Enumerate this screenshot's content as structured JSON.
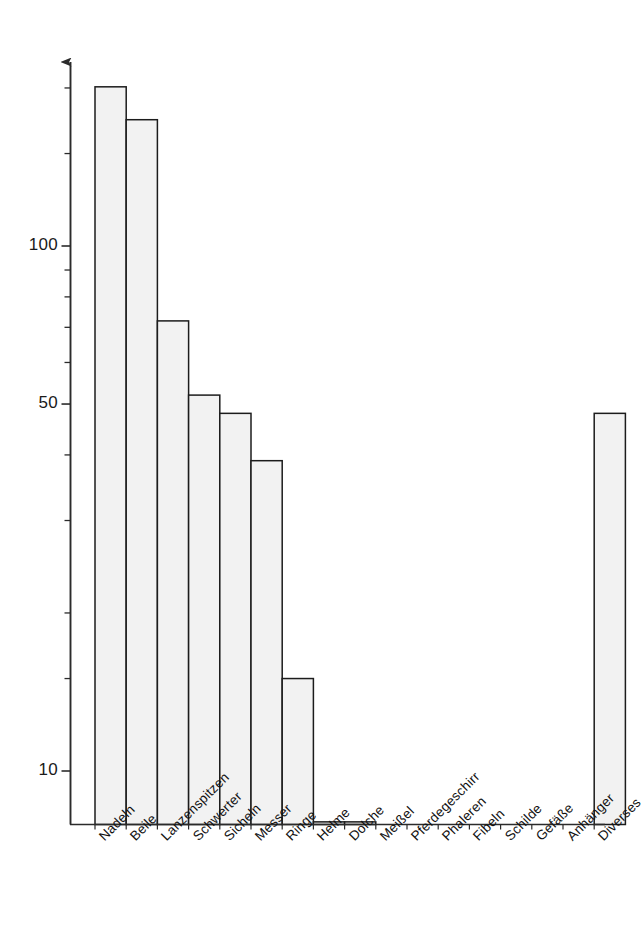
{
  "chart_data": {
    "type": "bar",
    "title": "",
    "subtitle": "",
    "xlabel": "",
    "ylabel": "",
    "yscale": "log",
    "ylim": [
      5,
      220
    ],
    "grid": false,
    "legend": null,
    "y_tick_labels": [
      "100",
      "50",
      "10"
    ],
    "y_tick_values": [
      100,
      50,
      10
    ],
    "y_minor_ticks": [
      200,
      150,
      90,
      80,
      70,
      60,
      40,
      30,
      20,
      15
    ],
    "categories": [
      "Nadeln",
      "Beile",
      "Lanzenspitzen",
      "Schwerter",
      "Sicheln",
      "Messer",
      "Ringe",
      "Helme",
      "Dolche",
      "Meißel",
      "Pferdegeschirr",
      "Phaleren",
      "Fibeln",
      "Schilde",
      "Gefäße",
      "Anhänger",
      "Diverses"
    ],
    "values": [
      201,
      174,
      72,
      52,
      48,
      39,
      15,
      8,
      8,
      7.6,
      7.6,
      7.2,
      7,
      7,
      7,
      7,
      48
    ]
  },
  "style": {
    "bar_fill": "#f2f2f2",
    "bar_edge": "#1c1c1c",
    "axis_color": "#2b2b2b",
    "label_color": "#111111",
    "background": "#ffffff"
  },
  "axis": {
    "arrow": "up-arrow-icon"
  }
}
